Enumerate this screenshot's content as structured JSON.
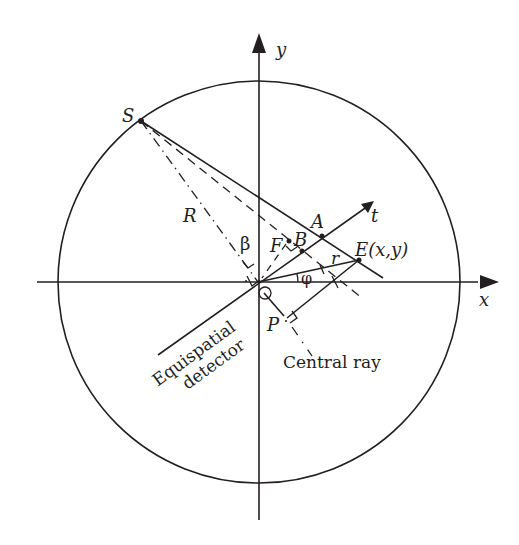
{
  "diagram": {
    "type": "fan-beam CT geometry",
    "axes": {
      "x_label": "x",
      "y_label": "y",
      "t_label": "t"
    },
    "points": {
      "source": "S",
      "origin": "O",
      "A": "A",
      "B": "B",
      "F": "F",
      "P": "P",
      "E": "E(x,y)"
    },
    "symbols": {
      "radius": "R",
      "r": "r",
      "beta": "β",
      "phi": "φ"
    },
    "annotations": {
      "detector_line1": "Equispatial",
      "detector_line2": "detector",
      "central_ray": "Central ray"
    },
    "colors": {
      "stroke": "#231f20",
      "background": "#ffffff"
    }
  }
}
